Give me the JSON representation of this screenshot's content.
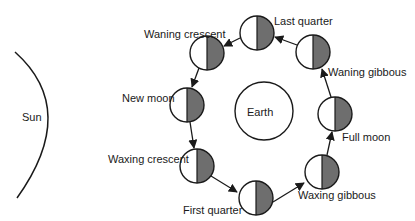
{
  "colors": {
    "outline": "#1a1a1a",
    "shade": "#6e6e6e",
    "background": "#ffffff"
  },
  "sun": {
    "label": "Sun"
  },
  "earth": {
    "label": "Earth"
  },
  "phases": [
    {
      "id": "last-quarter",
      "label": "Last quarter"
    },
    {
      "id": "waning-crescent",
      "label": "Waning crescent"
    },
    {
      "id": "new-moon",
      "label": "New moon"
    },
    {
      "id": "waxing-crescent",
      "label": "Waxing crescent"
    },
    {
      "id": "first-quarter",
      "label": "First quarter"
    },
    {
      "id": "waxing-gibbous",
      "label": "Waxing gibbous"
    },
    {
      "id": "full-moon",
      "label": "Full moon"
    },
    {
      "id": "waning-gibbous",
      "label": "Waning gibbous"
    }
  ]
}
